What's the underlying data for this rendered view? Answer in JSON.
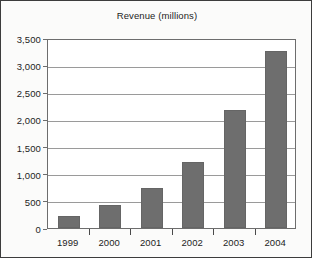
{
  "chart_data": {
    "type": "bar",
    "title": "Revenue (millions)",
    "xlabel": "",
    "ylabel": "",
    "categories": [
      "1999",
      "2000",
      "2001",
      "2002",
      "2003",
      "2004"
    ],
    "values": [
      230,
      430,
      730,
      1220,
      2180,
      3270
    ],
    "series": [
      {
        "name": "Revenue",
        "values": [
          230,
          430,
          730,
          1220,
          2180,
          3270
        ]
      }
    ],
    "ylim": [
      0,
      3500
    ],
    "ytick_values": [
      0,
      500,
      1000,
      1500,
      2000,
      2500,
      3000,
      3500
    ],
    "ytick_labels": [
      "0",
      "500",
      "1,000",
      "1,500",
      "2,000",
      "2,500",
      "3,000",
      "3,500"
    ],
    "grid": true,
    "legend": false,
    "legend_position": "none",
    "bar_color": "#6e6e6e",
    "plot_background": "#ffffff",
    "figure_background": "#fbfbfa",
    "axis_color": "#6d6d6d",
    "gridline_color": "#9a9a9a",
    "text_color": "#1d1d1d"
  }
}
